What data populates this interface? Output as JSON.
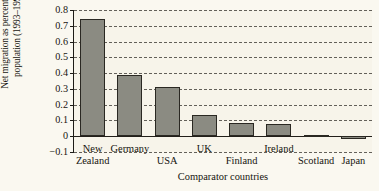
{
  "chart_data": {
    "type": "bar",
    "title": "",
    "xlabel": "Comparator countries",
    "ylabel": "Net migration as percentage of population (1993–1997)",
    "ylabel_line1": "Net migration as percentage of",
    "ylabel_line2": "population (1993–1997)",
    "categories": [
      "New Zealand",
      "Germany",
      "USA",
      "UK",
      "Finland",
      "Ireland",
      "Scotland",
      "Japan"
    ],
    "category_labels": [
      {
        "line1": "New",
        "line2": "Zealand"
      },
      {
        "line1": "Germany",
        "line2": ""
      },
      {
        "line1": "",
        "line2": "USA"
      },
      {
        "line1": "UK",
        "line2": ""
      },
      {
        "line1": "",
        "line2": "Finland"
      },
      {
        "line1": "Ireland",
        "line2": ""
      },
      {
        "line1": "",
        "line2": "Scotland"
      },
      {
        "line1": "",
        "line2": "Japan"
      }
    ],
    "values": [
      0.745,
      0.385,
      0.315,
      0.135,
      0.085,
      0.08,
      0.005,
      -0.015
    ],
    "ylim": [
      -0.1,
      0.8
    ],
    "yticks": [
      0.8,
      0.7,
      0.6,
      0.5,
      0.4,
      0.3,
      0.2,
      0.1,
      0,
      -0.1
    ],
    "ytick_labels": [
      "0.8",
      "0.7",
      "0.6",
      "0.5",
      "0.4",
      "0.3",
      "0.2",
      "0.1",
      "0",
      "−0.1"
    ],
    "grid": true,
    "grid_style": "dashed",
    "legend": "none",
    "bar_color": "#8b8b82",
    "bar_edge_color": "#2a2822",
    "background_color": "#f7f4ea",
    "axis_color": "#1d1b16"
  }
}
